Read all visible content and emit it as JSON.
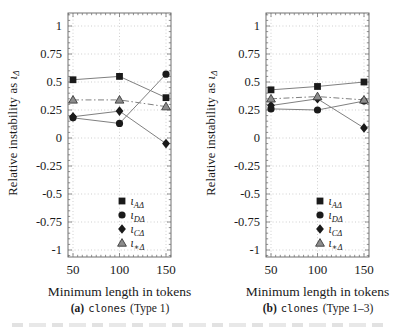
{
  "figure": {
    "ylabel_text": "Relative instability as ",
    "ylabel_symbol": "ι",
    "ylabel_sub": "Δ",
    "xlabel": "Minimum length in tokens",
    "xticks": [
      50,
      100,
      150
    ],
    "xtick_labels": [
      "50",
      "100",
      "150"
    ],
    "yticks": [
      1,
      0.75,
      0.5,
      0.25,
      0,
      -0.25,
      -0.5,
      -0.75,
      -1
    ],
    "ytick_labels": [
      "1",
      "0.75",
      "0.5",
      "0.25",
      "0",
      "-0.25",
      "-0.5",
      "-0.75",
      "-1"
    ],
    "colors": {
      "marker": "#1a1a1a",
      "triangle_fill": "#8c8c8c",
      "triangle_stroke": "#3a3a3a",
      "line": "#808080",
      "grid": "#c4c4c4",
      "axis": "#737373",
      "text": "#1a1a1a"
    }
  },
  "chart_data": [
    {
      "type": "line",
      "panel": "a",
      "caption": {
        "label": "(a)",
        "code": "clones",
        "suffix": "(Type 1)"
      },
      "xlabel": "Minimum length in tokens",
      "ylabel": "Relative instability as ιΔ",
      "x": [
        50,
        100,
        150
      ],
      "xlim": [
        45,
        155
      ],
      "ylim": [
        -1.06,
        1.12
      ],
      "grid": "dotted",
      "legend_position": "bottom-right-inside",
      "series": [
        {
          "name": "ι_AΔ",
          "legend_base": "ι",
          "legend_sub": "AΔ",
          "marker": "square",
          "line_style": "solid",
          "values": [
            0.52,
            0.55,
            0.36
          ]
        },
        {
          "name": "ι_DΔ",
          "legend_base": "ι",
          "legend_sub": "DΔ",
          "marker": "circle",
          "line_style": "solid",
          "values": [
            0.18,
            0.13,
            0.57
          ]
        },
        {
          "name": "ι_CΔ",
          "legend_base": "ι",
          "legend_sub": "CΔ",
          "marker": "diamond",
          "line_style": "solid",
          "values": [
            0.19,
            0.24,
            -0.05
          ]
        },
        {
          "name": "ι_∗Δ",
          "legend_base": "ι",
          "legend_sub": "∗Δ",
          "marker": "triangle",
          "line_style": "dashdot",
          "values": [
            0.34,
            0.34,
            0.28
          ]
        }
      ]
    },
    {
      "type": "line",
      "panel": "b",
      "caption": {
        "label": "(b)",
        "code": "clones",
        "suffix": "(Type 1–3)"
      },
      "xlabel": "Minimum length in tokens",
      "ylabel": "Relative instability as ιΔ",
      "x": [
        50,
        100,
        150
      ],
      "xlim": [
        45,
        155
      ],
      "ylim": [
        -1.06,
        1.12
      ],
      "grid": "dotted",
      "legend_position": "bottom-right-inside",
      "series": [
        {
          "name": "ι_AΔ",
          "legend_base": "ι",
          "legend_sub": "AΔ",
          "marker": "square",
          "line_style": "solid",
          "values": [
            0.43,
            0.46,
            0.5
          ]
        },
        {
          "name": "ι_DΔ",
          "legend_base": "ι",
          "legend_sub": "DΔ",
          "marker": "circle",
          "line_style": "solid",
          "values": [
            0.26,
            0.25,
            0.33
          ]
        },
        {
          "name": "ι_CΔ",
          "legend_base": "ι",
          "legend_sub": "CΔ",
          "marker": "diamond",
          "line_style": "solid",
          "values": [
            0.29,
            0.35,
            0.09
          ]
        },
        {
          "name": "ι_∗Δ",
          "legend_base": "ι",
          "legend_sub": "∗Δ",
          "marker": "triangle",
          "line_style": "dashdot",
          "values": [
            0.35,
            0.37,
            0.34
          ]
        }
      ]
    }
  ]
}
